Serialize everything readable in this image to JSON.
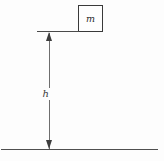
{
  "figure": {
    "kind": "physics-free-body-height-diagram",
    "background_color": "#fdfdfd",
    "ink_color": "#3a3a3a"
  },
  "mass": {
    "label": "m",
    "shape": "square-block",
    "border_color": "#3a3a3a",
    "fill_color": "#fefefe"
  },
  "height_dimension": {
    "label": "h",
    "arrow_style": "double-headed-vertical",
    "shaft_color": "#6e6e6e",
    "arrowhead_color": "#3d3d3d"
  },
  "reference_lines": {
    "top_label": "",
    "ground_label": "",
    "line_color": "#4f4f4f"
  }
}
